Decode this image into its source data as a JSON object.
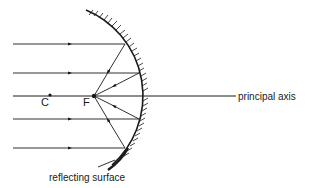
{
  "diagram": {
    "type": "concave-mirror-ray-diagram",
    "labels": {
      "center": "C",
      "focus": "F",
      "axis": "principal axis",
      "surface": "reflecting surface"
    },
    "colors": {
      "line": "#1a1a1a",
      "background": "#ffffff"
    },
    "points": {
      "C": [
        50,
        96
      ],
      "F": [
        94,
        96
      ]
    },
    "rays": [
      {
        "y": 44,
        "hit_x": 127
      },
      {
        "y": 73,
        "hit_x": 140
      },
      {
        "y": 96,
        "hit_x": 143
      },
      {
        "y": 119,
        "hit_x": 140
      },
      {
        "y": 148,
        "hit_x": 127
      }
    ]
  }
}
